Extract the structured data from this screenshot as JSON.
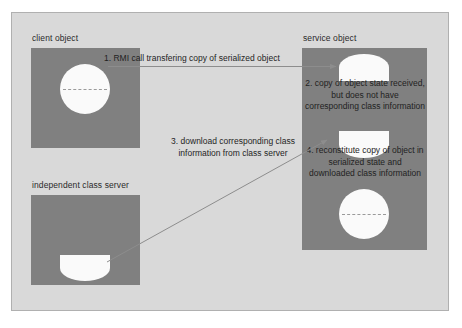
{
  "diagram": {
    "title_visible": false,
    "colors": {
      "page_background": "#ffffff",
      "panel_background": "#d9d9d9",
      "panel_border": "#b0b0b0",
      "box_fill": "#808080",
      "glyph_fill": "#fafafa",
      "text": "#1f1f1f",
      "arrow": "#8a8a8a"
    },
    "nodes": [
      {
        "id": "client-object",
        "label": "client object"
      },
      {
        "id": "service-object",
        "label": "service object"
      },
      {
        "id": "independent-class-server",
        "label": "independent class server"
      }
    ],
    "steps": [
      {
        "number": "1",
        "text": "1. RMI call transfering copy of serialized object",
        "from": "client-object",
        "to": "service-object"
      },
      {
        "number": "2",
        "text": "2. copy of object state received, but does not have corresponding class information",
        "at": "service-object"
      },
      {
        "number": "3",
        "text": "3. download corresponding class information from class server",
        "from": "independent-class-server",
        "to": "service-object"
      },
      {
        "number": "4",
        "text": "4. reconstitute copy of object in serialized state and downloaded class information",
        "at": "service-object"
      }
    ]
  }
}
